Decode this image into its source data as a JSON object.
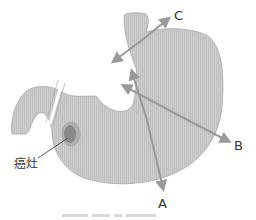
{
  "diagram": {
    "lesion_label": "癌灶",
    "arrows": [
      {
        "label": "A",
        "from": [
          132,
          72
        ],
        "to": [
          164,
          192
        ]
      },
      {
        "label": "B",
        "from": [
          122,
          86
        ],
        "to": [
          233,
          143
        ]
      },
      {
        "label": "C",
        "from": [
          112,
          62
        ],
        "to": [
          172,
          16
        ]
      }
    ],
    "colors": {
      "stomach_fill": "#c9c9c9",
      "stomach_stroke": "#a8a8a8",
      "arrow": "#9a9a9a",
      "lesion_outer": "#b0b0b0",
      "lesion_inner": "#8a8a8a",
      "text": "#333333"
    }
  }
}
